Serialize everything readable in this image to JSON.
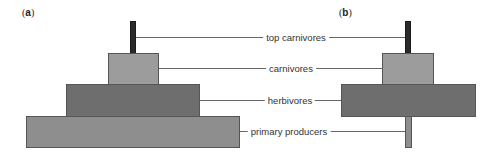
{
  "panels": {
    "a": {
      "label_open": "(",
      "label_letter": "a",
      "label_close": ")"
    },
    "b": {
      "label_open": "(",
      "label_letter": "b",
      "label_close": ")"
    }
  },
  "levels": [
    {
      "name": "top carnivores"
    },
    {
      "name": "carnivores"
    },
    {
      "name": "herbivores"
    },
    {
      "name": "primary producers"
    }
  ],
  "colors": {
    "top_carnivores": "#2a2a2a",
    "carnivores": "#9a9a9a",
    "herbivores": "#6e6e6e",
    "primary_producers": "#8c8c8c",
    "leader_line": "#666666"
  }
}
